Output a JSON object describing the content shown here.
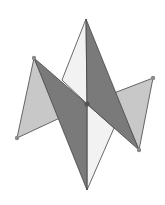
{
  "diagram": {
    "kind": "geometric-figure",
    "colors": {
      "background": "#ffffff",
      "light_gray": "#c8c8c8",
      "white_face": "#f2f2f2",
      "dark_gray": "#7a7a7a",
      "edge": "#444444",
      "vertex": "#8a8a8a",
      "center_vertex": "#555555"
    },
    "vertices": {
      "top": [
        86,
        19
      ],
      "upper_left": [
        34,
        58
      ],
      "center": [
        87,
        104
      ],
      "upper_right": [
        153,
        78
      ],
      "lower_left": [
        17,
        138
      ],
      "lower_right": [
        139,
        150
      ],
      "bottom": [
        87,
        190
      ]
    },
    "faces": [
      {
        "name": "left-side-triangle",
        "fill": "light_gray",
        "points": [
          [
            34,
            58
          ],
          [
            17,
            138
          ],
          [
            62,
            117
          ]
        ]
      },
      {
        "name": "right-side-triangle",
        "fill": "light_gray",
        "points": [
          [
            153,
            78
          ],
          [
            139,
            150
          ],
          [
            114,
            93
          ]
        ]
      },
      {
        "name": "upper-white-face",
        "fill": "white_face",
        "points": [
          [
            86,
            19
          ],
          [
            62,
            80
          ],
          [
            87,
            104
          ]
        ]
      },
      {
        "name": "lower-white-face",
        "fill": "white_face",
        "points": [
          [
            87,
            104
          ],
          [
            114,
            128
          ],
          [
            87,
            190
          ]
        ]
      },
      {
        "name": "left-dark-face",
        "fill": "dark_gray",
        "points": [
          [
            34,
            58
          ],
          [
            87,
            104
          ],
          [
            87,
            190
          ]
        ]
      },
      {
        "name": "right-dark-face",
        "fill": "dark_gray",
        "points": [
          [
            86,
            19
          ],
          [
            139,
            150
          ],
          [
            87,
            104
          ]
        ]
      }
    ],
    "marked_vertices": [
      "upper_left",
      "upper_right",
      "lower_left",
      "lower_right",
      "center"
    ]
  }
}
